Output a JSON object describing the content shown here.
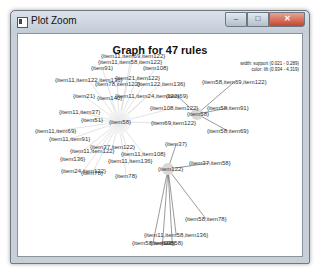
{
  "window": {
    "title": "Plot Zoom",
    "controls": {
      "minimize": "–",
      "maximize": "□",
      "close": "✕"
    }
  },
  "plot": {
    "title": "Graph for 47 rules",
    "legend": {
      "width": "width: support (0.021 - 0.289)",
      "color": "color: lift (0.934 - 4.319)"
    },
    "hubs": [
      {
        "label": "{item58}",
        "x": 118,
        "y": 121
      },
      {
        "label": "{item58}",
        "x": 196,
        "y": 113
      },
      {
        "label": "{item122}",
        "x": 167,
        "y": 168
      }
    ],
    "labels": [
      {
        "text": "{item11,item69,item122}",
        "x": 100,
        "y": 52
      },
      {
        "text": "{item11,item58,item122}",
        "x": 97,
        "y": 58
      },
      {
        "text": "{item91}",
        "x": 90,
        "y": 64
      },
      {
        "text": "{item108}",
        "x": 142,
        "y": 64
      },
      {
        "text": "{item21,item122}",
        "x": 114,
        "y": 74
      },
      {
        "text": "{item11,item122,item136}",
        "x": 54,
        "y": 76
      },
      {
        "text": "{item78,item122}",
        "x": 94,
        "y": 80
      },
      {
        "text": "{item122,item136}",
        "x": 136,
        "y": 80
      },
      {
        "text": "{item58,item69,item122}",
        "x": 201,
        "y": 78
      },
      {
        "text": "{item21}",
        "x": 72,
        "y": 92
      },
      {
        "text": "{item140}",
        "x": 96,
        "y": 94
      },
      {
        "text": "{item11,item24,item122}",
        "x": 114,
        "y": 92
      },
      {
        "text": "{item69}",
        "x": 165,
        "y": 92
      },
      {
        "text": "{item108,item122}",
        "x": 149,
        "y": 104
      },
      {
        "text": "{item58,item91}",
        "x": 206,
        "y": 104
      },
      {
        "text": "{item11,item37}",
        "x": 58,
        "y": 108
      },
      {
        "text": "{item51}",
        "x": 80,
        "y": 116
      },
      {
        "text": "{item69,item122}",
        "x": 150,
        "y": 119
      },
      {
        "text": "{item11,item69}",
        "x": 34,
        "y": 127
      },
      {
        "text": "{item58,item69}",
        "x": 206,
        "y": 127
      },
      {
        "text": "{item11,item91}",
        "x": 48,
        "y": 135
      },
      {
        "text": "{item37}",
        "x": 164,
        "y": 140
      },
      {
        "text": "{item37,item122}",
        "x": 89,
        "y": 143
      },
      {
        "text": "{item11,item122}",
        "x": 69,
        "y": 147
      },
      {
        "text": "{item11,item108}",
        "x": 120,
        "y": 150
      },
      {
        "text": "{item136}",
        "x": 59,
        "y": 155
      },
      {
        "text": "{item11,item136}",
        "x": 107,
        "y": 157
      },
      {
        "text": "{item37,item58}",
        "x": 188,
        "y": 159
      },
      {
        "text": "{item24,item122}",
        "x": 60,
        "y": 167
      },
      {
        "text": "{item78}",
        "x": 80,
        "y": 169
      },
      {
        "text": "{item78}",
        "x": 114,
        "y": 172
      },
      {
        "text": "{item58,item78}",
        "x": 184,
        "y": 215
      },
      {
        "text": "{item11,item58,item136}",
        "x": 143,
        "y": 231
      },
      {
        "text": "{item58,item21}",
        "x": 131,
        "y": 239
      },
      {
        "text": "{item108}",
        "x": 149,
        "y": 239
      },
      {
        "text": "{item58}",
        "x": 160,
        "y": 239
      }
    ]
  },
  "colors": {
    "edge": "#555555",
    "hub_fill": "#d8d8d8",
    "label": "#333333",
    "title": "#111111"
  }
}
